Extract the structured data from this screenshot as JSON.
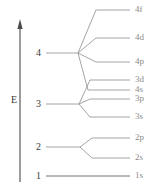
{
  "chart_data": {
    "type": "diagram",
    "ylabel": "E",
    "axis": {
      "label": "E",
      "direction": "up",
      "x": 20,
      "y_top": 22,
      "y_bottom": 182,
      "label_x": 11,
      "label_y": 95
    },
    "grid": false,
    "legend": false,
    "shells": [
      {
        "id": "shell-1",
        "label": "1",
        "label_x": 36,
        "label_y": 171,
        "node_x": 130,
        "node_y": 176,
        "stem_x": 46
      },
      {
        "id": "shell-2",
        "label": "2",
        "label_x": 36,
        "label_y": 142,
        "node_x": 80,
        "node_y": 147,
        "stem_x": 46
      },
      {
        "id": "shell-3",
        "label": "3",
        "label_x": 36,
        "label_y": 99,
        "node_x": 79,
        "node_y": 104,
        "stem_x": 46
      },
      {
        "id": "shell-4",
        "label": "4",
        "label_x": 36,
        "label_y": 48,
        "node_x": 78,
        "node_y": 53,
        "stem_x": 46
      }
    ],
    "orbitals": [
      {
        "id": "orb-4f",
        "label": "4f",
        "shell": 4,
        "n": 4,
        "subshell": "f",
        "y": 10,
        "line_x1": 96,
        "line_x2": 130,
        "branch_from_x": 78,
        "branch_from_y": 53,
        "label_x": 135,
        "label_y": 5
      },
      {
        "id": "orb-4d",
        "label": "4d",
        "shell": 4,
        "n": 4,
        "subshell": "d",
        "y": 38,
        "line_x1": 96,
        "line_x2": 130,
        "branch_from_x": 78,
        "branch_from_y": 53,
        "label_x": 135,
        "label_y": 33
      },
      {
        "id": "orb-4p",
        "label": "4p",
        "shell": 4,
        "n": 4,
        "subshell": "p",
        "y": 62,
        "line_x1": 96,
        "line_x2": 130,
        "branch_from_x": 78,
        "branch_from_y": 53,
        "label_x": 135,
        "label_y": 57
      },
      {
        "id": "orb-3d",
        "label": "3d",
        "shell": 3,
        "n": 3,
        "subshell": "d",
        "y": 80,
        "line_x1": 90,
        "line_x2": 130,
        "branch_from_x": 79,
        "branch_from_y": 104,
        "label_x": 135,
        "label_y": 75
      },
      {
        "id": "orb-4s",
        "label": "4s",
        "shell": 4,
        "n": 4,
        "subshell": "s",
        "y": 90,
        "line_x1": 88,
        "line_x2": 130,
        "branch_from_x": 78,
        "branch_from_y": 53,
        "label_x": 135,
        "label_y": 85
      },
      {
        "id": "orb-3p",
        "label": "3p",
        "shell": 3,
        "n": 3,
        "subshell": "p",
        "y": 99,
        "line_x1": 90,
        "line_x2": 130,
        "branch_from_x": 79,
        "branch_from_y": 104,
        "label_x": 135,
        "label_y": 94
      },
      {
        "id": "orb-3s",
        "label": "3s",
        "shell": 3,
        "n": 3,
        "subshell": "s",
        "y": 117,
        "line_x1": 90,
        "line_x2": 130,
        "branch_from_x": 79,
        "branch_from_y": 104,
        "label_x": 135,
        "label_y": 112
      },
      {
        "id": "orb-2p",
        "label": "2p",
        "shell": 2,
        "n": 2,
        "subshell": "p",
        "y": 138,
        "line_x1": 92,
        "line_x2": 130,
        "branch_from_x": 80,
        "branch_from_y": 147,
        "label_x": 135,
        "label_y": 133
      },
      {
        "id": "orb-2s",
        "label": "2s",
        "shell": 2,
        "n": 2,
        "subshell": "s",
        "y": 158,
        "line_x1": 92,
        "line_x2": 130,
        "branch_from_x": 80,
        "branch_from_y": 147,
        "label_x": 135,
        "label_y": 153
      },
      {
        "id": "orb-1s",
        "label": "1s",
        "shell": 1,
        "n": 1,
        "subshell": "s",
        "y": 176,
        "line_x1": 46,
        "line_x2": 130,
        "branch_from_x": 46,
        "branch_from_y": 176,
        "label_x": 135,
        "label_y": 171
      }
    ],
    "colors": {
      "line": "#9a9a9a",
      "axis": "#4a4a4a",
      "shell_text": "#3a3a3a",
      "orbital_text": "#8a8a8a",
      "background": "#ffffff"
    }
  }
}
